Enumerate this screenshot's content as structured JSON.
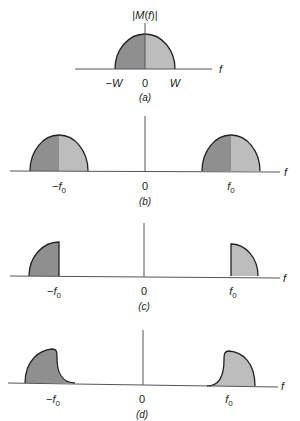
{
  "colors": {
    "dark_fill": "#8f8f8f",
    "light_fill": "#bdbdbd",
    "outline": "#222222",
    "axis": "#555555"
  },
  "panels": [
    {
      "id": "a",
      "caption": "(a)",
      "y_label": "|M(f)|",
      "axis_label": "f",
      "ticks": [
        "−W",
        "0",
        "W"
      ],
      "description": "Baseband message spectrum, half-ellipse from −W to W, dark left half and light right half"
    },
    {
      "id": "b",
      "caption": "(b)",
      "axis_label": "f",
      "ticks": [
        "−f0",
        "0",
        "f0"
      ],
      "description": "DSB spectrum: two lobes centered at −f0 and f0, each with lower (dark) and upper (light) sidebands"
    },
    {
      "id": "c",
      "caption": "(c)",
      "axis_label": "f",
      "ticks": [
        "−f0",
        "0",
        "f0"
      ],
      "description": "SSB (upper sideband only) — quarter lobes outside ±f0"
    },
    {
      "id": "d",
      "caption": "(d)",
      "axis_label": "f",
      "ticks": [
        "−f0",
        "0",
        "f0"
      ],
      "description": "VSB spectrum — one sideband with a vestige tapering across f0"
    }
  ]
}
